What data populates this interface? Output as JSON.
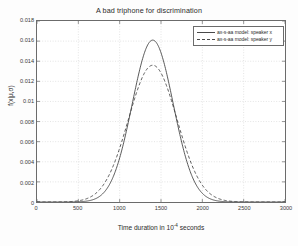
{
  "chart_data": {
    "type": "line",
    "title": "A bad triphone for discrimination",
    "xlabel_prefix": "Time duration in 10",
    "xlabel_exponent": "-4",
    "xlabel_suffix": " seconds",
    "ylabel": "f(x|μ,σ)",
    "xlim": [
      0,
      3000
    ],
    "ylim": [
      0,
      0.018
    ],
    "grid": true,
    "legend_position": "upper right",
    "xticks": [
      0,
      500,
      1000,
      1500,
      2000,
      2500,
      3000
    ],
    "xtick_labels": [
      "0",
      "500",
      "1000",
      "1500",
      "2000",
      "2500",
      "3000"
    ],
    "yticks": [
      0,
      0.002,
      0.004,
      0.006,
      0.008,
      0.01,
      0.012,
      0.014,
      0.016,
      0.018
    ],
    "ytick_labels": [
      "0",
      "0.002",
      "0.004",
      "0.006",
      "0.008",
      "0.01",
      "0.012",
      "0.014",
      "0.016",
      "0.018"
    ],
    "series": [
      {
        "name": "ax-s-aa model: speaker x",
        "style": "solid",
        "color": "#3c3c3c",
        "distribution": "gaussian",
        "mu": 1400,
        "sigma": 248,
        "peak": 0.0161,
        "x": [
          0,
          200,
          400,
          500,
          600,
          700,
          800,
          900,
          1000,
          1100,
          1200,
          1300,
          1400,
          1500,
          1600,
          1700,
          1800,
          1900,
          2000,
          2100,
          2200,
          2400,
          2600,
          3000
        ],
        "y": [
          0.0,
          0.0,
          2e-05,
          9e-05,
          0.0003,
          0.00085,
          0.00199,
          0.00391,
          0.00652,
          0.00955,
          0.01254,
          0.01486,
          0.0161,
          0.01486,
          0.01254,
          0.00955,
          0.00652,
          0.00391,
          0.00199,
          0.00085,
          0.0003,
          2e-05,
          0.0,
          0.0
        ]
      },
      {
        "name": "ax-s-aa model: speaker y",
        "style": "dashed",
        "color": "#3c3c3c",
        "distribution": "gaussian",
        "mu": 1400,
        "sigma": 293,
        "peak": 0.0136,
        "x": [
          0,
          200,
          400,
          500,
          600,
          700,
          800,
          900,
          1000,
          1100,
          1200,
          1300,
          1400,
          1500,
          1600,
          1700,
          1800,
          1900,
          2000,
          2100,
          2200,
          2400,
          2600,
          3000
        ],
        "y": [
          0.0,
          1e-05,
          0.00011,
          0.00029,
          0.00068,
          0.00142,
          0.00269,
          0.00454,
          0.00684,
          0.00929,
          0.01146,
          0.01295,
          0.0136,
          0.01295,
          0.01146,
          0.00929,
          0.00684,
          0.00454,
          0.00269,
          0.00142,
          0.00068,
          0.00011,
          1e-05,
          0.0
        ]
      }
    ]
  }
}
